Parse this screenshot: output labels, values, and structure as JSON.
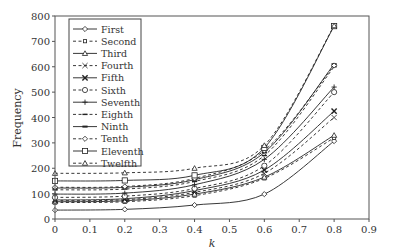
{
  "chart_data": {
    "type": "line",
    "title": "",
    "xlabel": "k",
    "ylabel": "Frequency",
    "xlim": [
      0,
      0.9
    ],
    "ylim": [
      0,
      800
    ],
    "xticks": [
      "0",
      "0.1",
      "0.2",
      "0.3",
      "0.4",
      "0.5",
      "0.6",
      "0.7",
      "0.8",
      "0.9"
    ],
    "yticks": [
      "0",
      "100",
      "200",
      "300",
      "400",
      "500",
      "600",
      "700",
      "800"
    ],
    "grid": false,
    "legend_position": "upper-left",
    "x": [
      0,
      0.2,
      0.4,
      0.6,
      0.8
    ],
    "series": [
      {
        "name": "First",
        "style": "solid",
        "marker": "diamond",
        "values": [
          35,
          38,
          55,
          98,
          307
        ]
      },
      {
        "name": "Second",
        "style": "dashed",
        "marker": "square-small",
        "values": [
          65,
          68,
          92,
          160,
          320
        ]
      },
      {
        "name": "Third",
        "style": "solid",
        "marker": "triangle",
        "values": [
          68,
          72,
          98,
          165,
          330
        ]
      },
      {
        "name": "Fourth",
        "style": "dashed",
        "marker": "x",
        "values": [
          72,
          76,
          105,
          180,
          400
        ]
      },
      {
        "name": "Fifth",
        "style": "solid",
        "marker": "x-bold",
        "values": [
          75,
          80,
          112,
          193,
          425
        ]
      },
      {
        "name": "Sixth",
        "style": "dashed",
        "marker": "circle",
        "values": [
          85,
          90,
          120,
          210,
          500
        ]
      },
      {
        "name": "Seventh",
        "style": "solid",
        "marker": "plus",
        "values": [
          98,
          102,
          135,
          235,
          520
        ]
      },
      {
        "name": "Eighth",
        "style": "dashed",
        "marker": "dash",
        "values": [
          115,
          118,
          148,
          250,
          600
        ]
      },
      {
        "name": "Ninth",
        "style": "solid",
        "marker": "dash-bold",
        "values": [
          122,
          125,
          155,
          262,
          610
        ]
      },
      {
        "name": "Tenth",
        "style": "dashed",
        "marker": "diamond",
        "values": [
          125,
          128,
          160,
          270,
          605
        ]
      },
      {
        "name": "Eleventh",
        "style": "solid",
        "marker": "square",
        "values": [
          150,
          152,
          172,
          280,
          760
        ]
      },
      {
        "name": "Twelfth",
        "style": "dashed",
        "marker": "triangle",
        "values": [
          180,
          182,
          200,
          290,
          762
        ]
      }
    ]
  }
}
